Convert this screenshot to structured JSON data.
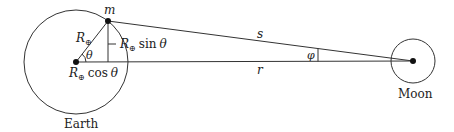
{
  "diagram": {
    "stroke_color": "#333333",
    "background": "#ffffff",
    "earth": {
      "label": "Earth",
      "center": [
        76,
        62
      ],
      "radius": 52
    },
    "moon": {
      "label": "Moon",
      "center": [
        413,
        61
      ],
      "radius": 22
    },
    "point_m": {
      "label": "m",
      "position": [
        108,
        21
      ]
    },
    "labels": {
      "radius": "R",
      "earth_symbol": "⊕",
      "theta": "θ",
      "sin_label_suffix": "sin",
      "cos_label_suffix": "cos",
      "s": "s",
      "r": "r",
      "phi": "φ"
    }
  }
}
